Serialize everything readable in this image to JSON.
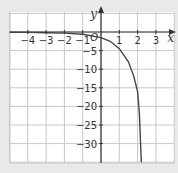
{
  "chart_data": {
    "type": "line",
    "title": "",
    "xlabel": "x",
    "ylabel": "y",
    "xlim": [
      -5,
      4
    ],
    "ylim": [
      -35,
      1
    ],
    "grid": true,
    "x_ticks": [
      -4,
      -3,
      -2,
      -1,
      1,
      2,
      3
    ],
    "x_tick_labels": [
      "−4",
      "−3",
      "−2",
      "−1",
      "1",
      "2",
      "3"
    ],
    "y_ticks": [
      -5,
      -10,
      -15,
      -20,
      -25,
      -30
    ],
    "y_tick_labels": [
      "−5",
      "−10",
      "−15",
      "−20",
      "−25",
      "−30"
    ],
    "origin_label": "O",
    "series": [
      {
        "name": "curve",
        "x": [
          -5,
          -4,
          -3,
          -2,
          -1,
          0,
          0.5,
          1,
          1.5,
          1.8,
          2,
          2.1,
          2.2
        ],
        "y": [
          -0.05,
          -0.1,
          -0.2,
          -0.3,
          -0.6,
          -1.5,
          -2.5,
          -4.5,
          -8,
          -12,
          -16,
          -22,
          -35
        ]
      }
    ]
  },
  "colors": {
    "background": "#e9e9e9",
    "plot_area": "#ffffff",
    "grid": "#c8c8c8",
    "axis": "#333333",
    "curve": "#444444"
  }
}
